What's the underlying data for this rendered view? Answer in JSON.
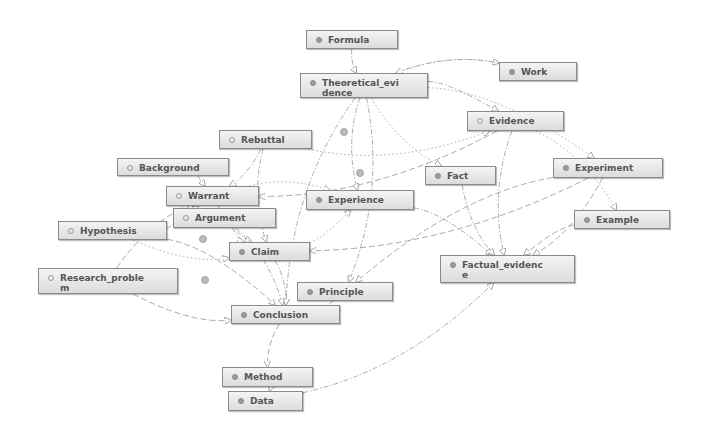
{
  "diagram": {
    "title": "",
    "nodes": [
      {
        "id": "formula",
        "label": "Formula",
        "icon": "filled-circle-icon",
        "x": 306,
        "y": 30,
        "w": 92,
        "h": 19
      },
      {
        "id": "theoretical_evidence",
        "label": "Theoretical_evidence",
        "display": "Theoretical_evi\ndence",
        "icon": "filled-circle-icon",
        "x": 300,
        "y": 73,
        "w": 128,
        "h": 25
      },
      {
        "id": "work",
        "label": "Work",
        "icon": "filled-circle-icon",
        "x": 499,
        "y": 62,
        "w": 78,
        "h": 19
      },
      {
        "id": "evidence",
        "label": "Evidence",
        "icon": "hollow-circle-icon",
        "x": 467,
        "y": 111,
        "w": 97,
        "h": 20
      },
      {
        "id": "rebuttal",
        "label": "Rebuttal",
        "icon": "hollow-circle-icon",
        "x": 219,
        "y": 130,
        "w": 93,
        "h": 19
      },
      {
        "id": "background",
        "label": "Background",
        "icon": "hollow-circle-icon",
        "x": 117,
        "y": 158,
        "w": 112,
        "h": 18
      },
      {
        "id": "fact",
        "label": "Fact",
        "icon": "filled-circle-icon",
        "x": 425,
        "y": 166,
        "w": 71,
        "h": 19
      },
      {
        "id": "experiment",
        "label": "Experiment",
        "icon": "filled-circle-icon",
        "x": 553,
        "y": 158,
        "w": 110,
        "h": 20
      },
      {
        "id": "warrant",
        "label": "Warrant",
        "icon": "hollow-circle-icon",
        "x": 166,
        "y": 186,
        "w": 93,
        "h": 20
      },
      {
        "id": "experience",
        "label": "Experience",
        "icon": "filled-circle-icon",
        "x": 306,
        "y": 190,
        "w": 108,
        "h": 20
      },
      {
        "id": "argument",
        "label": "Argument",
        "icon": "hollow-circle-icon",
        "x": 173,
        "y": 208,
        "w": 103,
        "h": 20
      },
      {
        "id": "example",
        "label": "Example",
        "icon": "filled-circle-icon",
        "x": 574,
        "y": 210,
        "w": 96,
        "h": 19
      },
      {
        "id": "hypothesis",
        "label": "Hypothesis",
        "icon": "hollow-circle-icon",
        "x": 58,
        "y": 221,
        "w": 109,
        "h": 19
      },
      {
        "id": "claim",
        "label": "Claim",
        "icon": "filled-circle-icon",
        "x": 229,
        "y": 242,
        "w": 81,
        "h": 19
      },
      {
        "id": "factual_evidence",
        "label": "Factual_evidence",
        "display": "Factual_evidenc\ne",
        "icon": "filled-circle-icon",
        "x": 440,
        "y": 255,
        "w": 135,
        "h": 28
      },
      {
        "id": "research_problem",
        "label": "Research_problem",
        "display": "Research_proble\nm",
        "icon": "hollow-circle-icon",
        "x": 38,
        "y": 268,
        "w": 140,
        "h": 26
      },
      {
        "id": "principle",
        "label": "Principle",
        "icon": "filled-circle-icon",
        "x": 297,
        "y": 282,
        "w": 96,
        "h": 19
      },
      {
        "id": "conclusion",
        "label": "Conclusion",
        "icon": "filled-circle-icon",
        "x": 231,
        "y": 305,
        "w": 109,
        "h": 19
      },
      {
        "id": "method",
        "label": "Method",
        "icon": "filled-circle-icon",
        "x": 222,
        "y": 367,
        "w": 91,
        "h": 20
      },
      {
        "id": "data",
        "label": "Data",
        "icon": "filled-circle-icon",
        "x": 228,
        "y": 391,
        "w": 75,
        "h": 20
      }
    ],
    "edges": [
      {
        "from": "formula",
        "to": "theoretical_evidence",
        "style": "dash-dot"
      },
      {
        "from": "theoretical_evidence",
        "to": "work",
        "style": "dash-dot"
      },
      {
        "from": "work",
        "to": "theoretical_evidence",
        "style": "dotted"
      },
      {
        "from": "theoretical_evidence",
        "to": "evidence",
        "style": "dash-dot"
      },
      {
        "from": "theoretical_evidence",
        "to": "experience",
        "style": "dash-dot"
      },
      {
        "from": "theoretical_evidence",
        "to": "principle",
        "style": "dash-dot"
      },
      {
        "from": "theoretical_evidence",
        "to": "conclusion",
        "style": "dash-dot"
      },
      {
        "from": "theoretical_evidence",
        "to": "experiment",
        "style": "dotted"
      },
      {
        "from": "theoretical_evidence",
        "to": "fact",
        "style": "dotted"
      },
      {
        "from": "evidence",
        "to": "warrant",
        "style": "dashed"
      },
      {
        "from": "evidence",
        "to": "factual_evidence",
        "style": "dash-dot"
      },
      {
        "from": "evidence",
        "to": "example",
        "style": "dotted"
      },
      {
        "from": "rebuttal",
        "to": "evidence",
        "style": "dotted"
      },
      {
        "from": "rebuttal",
        "to": "warrant",
        "style": "dash-dot"
      },
      {
        "from": "rebuttal",
        "to": "claim",
        "style": "dash-dot"
      },
      {
        "from": "background",
        "to": "warrant",
        "style": "dash-dot"
      },
      {
        "from": "warrant",
        "to": "claim",
        "style": "dash-dot"
      },
      {
        "from": "warrant",
        "to": "experience",
        "style": "dotted"
      },
      {
        "from": "argument",
        "to": "claim",
        "style": "dash-dot"
      },
      {
        "from": "argument",
        "to": "conclusion",
        "style": "dash-dot"
      },
      {
        "from": "hypothesis",
        "to": "claim",
        "style": "dotted"
      },
      {
        "from": "hypothesis",
        "to": "conclusion",
        "style": "dashed"
      },
      {
        "from": "hypothesis",
        "to": "warrant",
        "style": "dash-dot"
      },
      {
        "from": "research_problem",
        "to": "warrant",
        "style": "dashed"
      },
      {
        "from": "research_problem",
        "to": "conclusion",
        "style": "dashed"
      },
      {
        "from": "claim",
        "to": "conclusion",
        "style": "dash-dot"
      },
      {
        "from": "claim",
        "to": "experience",
        "style": "dotted"
      },
      {
        "from": "experience",
        "to": "factual_evidence",
        "style": "dash-dot"
      },
      {
        "from": "fact",
        "to": "factual_evidence",
        "style": "dash-dot"
      },
      {
        "from": "experiment",
        "to": "factual_evidence",
        "style": "dashed"
      },
      {
        "from": "experiment",
        "to": "principle",
        "style": "dashed"
      },
      {
        "from": "experiment",
        "to": "claim",
        "style": "dashed"
      },
      {
        "from": "example",
        "to": "factual_evidence",
        "style": "dashed"
      },
      {
        "from": "principle",
        "to": "conclusion",
        "style": "dash-dot"
      },
      {
        "from": "conclusion",
        "to": "method",
        "style": "dashed"
      },
      {
        "from": "method",
        "to": "data",
        "style": "dash-dot"
      },
      {
        "from": "data",
        "to": "factual_evidence",
        "style": "dash-dot"
      }
    ]
  },
  "colors": {
    "node_border": "#8a8a8a",
    "node_fill_top": "#f4f4f4",
    "node_fill_bottom": "#dcdcdc",
    "node_text": "#555555",
    "edge": "#aaaaaa",
    "icon_filled": "#9a9a9a"
  }
}
